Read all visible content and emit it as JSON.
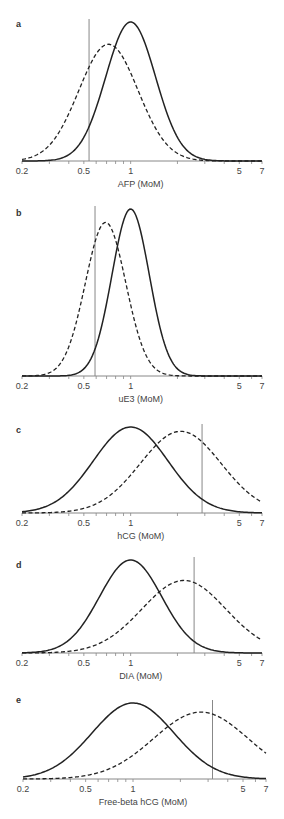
{
  "chart_data": [
    {
      "type": "line",
      "panel": "a",
      "xlabel": "AFP (MoM)",
      "xscale": "log",
      "xlim": [
        0.2,
        7
      ],
      "xticks_labeled": [
        "0.2",
        "0.5",
        "1",
        "5",
        "7"
      ],
      "cutoff_mom": 0.54,
      "series": [
        {
          "name": "unaffected",
          "style": "solid",
          "median_mom": 1.0,
          "log10_sd": 0.16,
          "relative_peak": 1.0
        },
        {
          "name": "affected",
          "style": "dashed",
          "median_mom": 0.72,
          "log10_sd": 0.19,
          "relative_peak": 0.84
        }
      ]
    },
    {
      "type": "line",
      "panel": "b",
      "xlabel": "uE3 (MoM)",
      "xscale": "log",
      "xlim": [
        0.2,
        7
      ],
      "xticks_labeled": [
        "0.2",
        "0.5",
        "1",
        "5",
        "7"
      ],
      "cutoff_mom": 0.59,
      "series": [
        {
          "name": "unaffected",
          "style": "solid",
          "median_mom": 1.0,
          "log10_sd": 0.12,
          "relative_peak": 1.0
        },
        {
          "name": "affected",
          "style": "dashed",
          "median_mom": 0.69,
          "log10_sd": 0.13,
          "relative_peak": 0.92
        }
      ]
    },
    {
      "type": "line",
      "panel": "c",
      "xlabel": "hCG (MoM)",
      "xscale": "log",
      "xlim": [
        0.2,
        7
      ],
      "xticks_labeled": [
        "0.2",
        "0.5",
        "1",
        "5",
        "7"
      ],
      "cutoff_mom": 2.88,
      "series": [
        {
          "name": "unaffected",
          "style": "solid",
          "median_mom": 1.0,
          "log10_sd": 0.24,
          "relative_peak": 1.0
        },
        {
          "name": "affected",
          "style": "dashed",
          "median_mom": 2.1,
          "log10_sd": 0.26,
          "relative_peak": 0.95
        }
      ]
    },
    {
      "type": "line",
      "panel": "d",
      "xlabel": "DIA (MoM)",
      "xscale": "log",
      "xlim": [
        0.2,
        7
      ],
      "xticks_labeled": [
        "0.2",
        "0.5",
        "1",
        "5",
        "7"
      ],
      "cutoff_mom": 2.56,
      "series": [
        {
          "name": "unaffected",
          "style": "solid",
          "median_mom": 1.0,
          "log10_sd": 0.2,
          "relative_peak": 1.0
        },
        {
          "name": "affected",
          "style": "dashed",
          "median_mom": 2.2,
          "log10_sd": 0.27,
          "relative_peak": 0.78
        }
      ]
    },
    {
      "type": "line",
      "panel": "e",
      "xlabel": "Free-beta hCG (MoM)",
      "xscale": "log",
      "xlim": [
        0.2,
        7
      ],
      "xticks_labeled": [
        "0.2",
        "0.5",
        "1",
        "5",
        "7"
      ],
      "cutoff_mom": 3.2,
      "series": [
        {
          "name": "unaffected",
          "style": "solid",
          "median_mom": 1.0,
          "log10_sd": 0.26,
          "relative_peak": 1.0
        },
        {
          "name": "affected",
          "style": "dashed",
          "median_mom": 2.7,
          "log10_sd": 0.3,
          "relative_peak": 0.88
        }
      ]
    }
  ]
}
